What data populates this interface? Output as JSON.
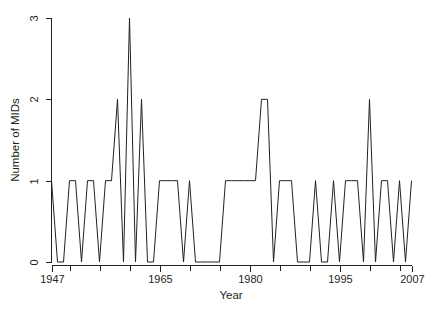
{
  "chart_data": {
    "type": "line",
    "title": "",
    "subtitle": "",
    "xlabel": "Year",
    "ylabel": "Number of MIDs",
    "xlim": [
      1947,
      2007
    ],
    "ylim": [
      0,
      3
    ],
    "grid": false,
    "legend": null,
    "xtick_labels": [
      "1947",
      "1965",
      "1980",
      "1995",
      "2007"
    ],
    "xtick_values": [
      1947,
      1965,
      1980,
      1995,
      2007
    ],
    "ytick_labels": [
      "0",
      "1",
      "2",
      "3"
    ],
    "ytick_values": [
      0,
      1,
      2,
      3
    ],
    "line_color": "#231f20",
    "x": [
      1947,
      1948,
      1949,
      1950,
      1951,
      1952,
      1953,
      1954,
      1955,
      1956,
      1957,
      1958,
      1959,
      1960,
      1961,
      1962,
      1963,
      1964,
      1965,
      1966,
      1967,
      1968,
      1969,
      1970,
      1971,
      1972,
      1973,
      1974,
      1975,
      1976,
      1977,
      1978,
      1979,
      1980,
      1981,
      1982,
      1983,
      1984,
      1985,
      1986,
      1987,
      1988,
      1989,
      1990,
      1991,
      1992,
      1993,
      1994,
      1995,
      1996,
      1997,
      1998,
      1999,
      2000,
      2001,
      2002,
      2003,
      2004,
      2005,
      2006,
      2007
    ],
    "values": [
      1,
      0,
      0,
      1,
      1,
      0,
      1,
      1,
      0,
      1,
      1,
      2,
      0,
      3,
      0,
      2,
      0,
      0,
      1,
      1,
      1,
      1,
      0,
      1,
      0,
      0,
      0,
      0,
      0,
      1,
      1,
      1,
      1,
      1,
      1,
      2,
      2,
      0,
      1,
      1,
      1,
      0,
      0,
      0,
      1,
      0,
      0,
      1,
      0,
      1,
      1,
      1,
      0,
      2,
      0,
      1,
      1,
      0,
      1,
      0,
      1
    ],
    "series": [
      {
        "name": "Number of MIDs",
        "values": [
          1,
          0,
          0,
          1,
          1,
          0,
          1,
          1,
          0,
          1,
          1,
          2,
          0,
          3,
          0,
          2,
          0,
          0,
          1,
          1,
          1,
          1,
          0,
          1,
          0,
          0,
          0,
          0,
          0,
          1,
          1,
          1,
          1,
          1,
          1,
          2,
          2,
          0,
          1,
          1,
          1,
          0,
          0,
          0,
          1,
          0,
          0,
          1,
          0,
          1,
          1,
          1,
          0,
          2,
          0,
          1,
          1,
          0,
          1,
          0,
          1
        ]
      }
    ]
  },
  "axes": {
    "x_title": "Year",
    "y_title": "Number of MIDs"
  }
}
